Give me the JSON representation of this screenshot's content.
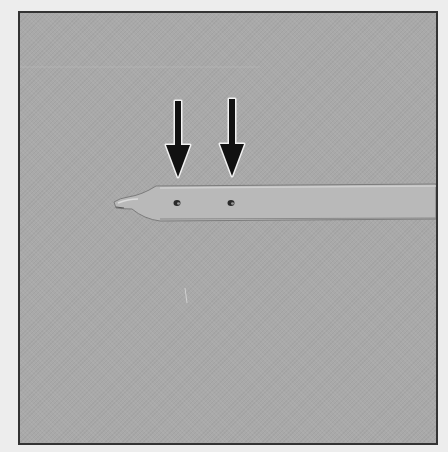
{
  "figure": {
    "colors": {
      "background": "#a9a9a9",
      "tube": "#b7b7b7",
      "tube_edge": "#7a7a7a",
      "arrow": "#111111",
      "arrow_halo": "#f2f2f2",
      "frame": "#333333"
    },
    "arrows": [
      {
        "label": "side-hole-1",
        "x": 158,
        "tip_y": 163
      },
      {
        "label": "side-hole-2",
        "x": 212,
        "tip_y": 163
      }
    ],
    "holes": [
      {
        "x": 156,
        "y": 190
      },
      {
        "x": 210,
        "y": 190
      }
    ]
  }
}
